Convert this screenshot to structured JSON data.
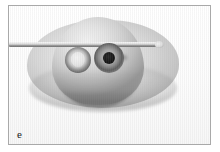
{
  "figure": {
    "panel_label": "e",
    "kind": "grayscale-micrograph",
    "caption_text": "",
    "frame": {
      "border_color": "#a9a9a9",
      "background_color": "#fdfdfd"
    }
  },
  "specimen": {
    "base": {
      "name": "elliptical flattened base",
      "fill_color": "#e2e2e2",
      "edge_color": "#bdbdbd"
    },
    "dome": {
      "name": "raised central dome",
      "highlight_color": "#f2f2f2",
      "shadow_color": "#9a9a9a"
    },
    "features": [
      {
        "name": "left ring structure",
        "center_color": "#efefef",
        "rim_color": "#6a6a6a"
      },
      {
        "name": "right ring structure with dark pore",
        "center_color": "#0d0d0d",
        "rim_color": "#5e5e5e"
      }
    ],
    "artefact": {
      "name": "faint smudge on right flank",
      "color": "#5a5a5a"
    }
  },
  "instrument": {
    "name": "horizontal rod fibre",
    "highlight_color": "#f6f6f6",
    "shadow_color": "#6f6f6f",
    "orientation": "horizontal"
  },
  "palette": {
    "page_background": "#ffffff",
    "ink": "#1c1c1c"
  }
}
